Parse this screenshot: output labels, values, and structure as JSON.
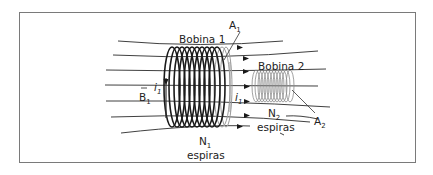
{
  "diagram": {
    "labels": {
      "coil1": "Bobina 1",
      "coil2": "Bobina 2",
      "area1_main": "A",
      "area1_sub": "1",
      "area2_main": "A",
      "area2_sub": "2",
      "current_left_main": "i",
      "current_left_sub": "1",
      "current_right_main": "i",
      "current_right_sub": "1",
      "field_main": "B",
      "field_sub": "1",
      "turns1_main": "N",
      "turns1_sub": "1",
      "turns1_word": "espiras",
      "turns2_main": "N",
      "turns2_sub": "2",
      "turns2_word": "espiras"
    },
    "colors": {
      "frame": "#7a7a7a",
      "ink": "#1a1a1a",
      "coil2": "#8a8a8a"
    },
    "coil1_turns_drawn": 10,
    "coil2_turns_drawn": 12
  }
}
